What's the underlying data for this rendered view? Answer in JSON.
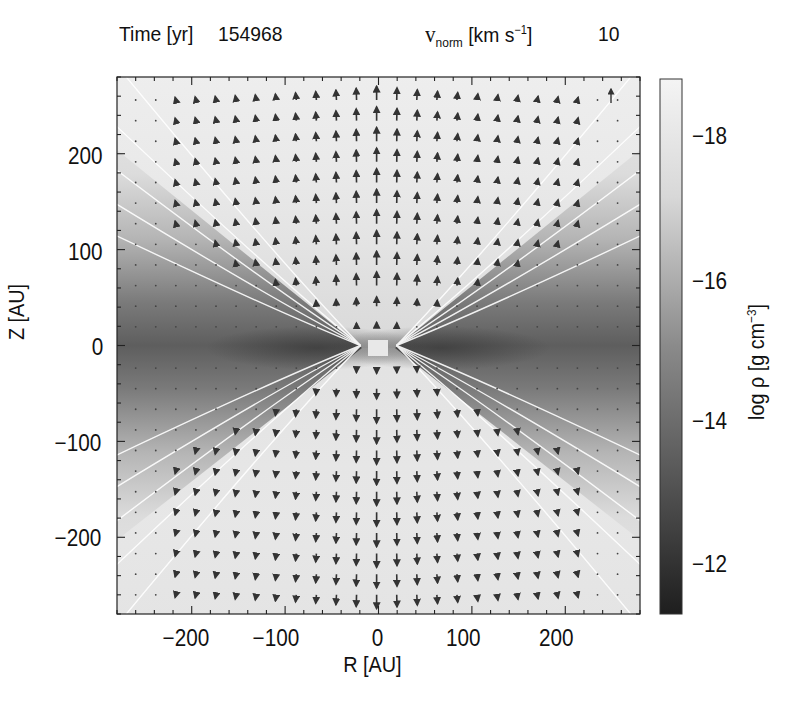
{
  "header": {
    "time_label": "Time [yr]",
    "time_value": "154968",
    "vnorm_symbol": "v",
    "vnorm_sub": "norm",
    "vnorm_unit_pre": "[km s",
    "vnorm_unit_sup": "−1",
    "vnorm_unit_post": "]",
    "vnorm_value": "10"
  },
  "colorbar": {
    "label_pre": "log ρ [g cm",
    "label_sup": "−3",
    "label_post": "]",
    "ticks": [
      "−18",
      "−16",
      "−14",
      "−12"
    ],
    "dark_color": "#222222",
    "light_color": "#f2f2f2"
  },
  "chart_data": {
    "type": "heatmap",
    "subtype": "density map with velocity vector overlay",
    "annotation": "v_norm [km s^-1] 10",
    "xlabel": "R [AU]",
    "ylabel": "Z [AU]",
    "xlim": [
      -280,
      280
    ],
    "ylim": [
      -280,
      280
    ],
    "xticks": [
      -200,
      -100,
      0,
      100,
      200
    ],
    "yticks": [
      -200,
      -100,
      0,
      100,
      200
    ],
    "xtick_labels": [
      "−200",
      "−100",
      "0",
      "100",
      "200"
    ],
    "ytick_labels": [
      "−200",
      "−100",
      "0",
      "100",
      "200"
    ],
    "colorbar": {
      "label": "log ρ [g cm^-3]",
      "range": [
        -11.4,
        -18.8
      ],
      "ticks": [
        -18,
        -16,
        -14,
        -12
      ],
      "colormap": "grayscale (dark = dense)"
    },
    "features": [
      "Dense dark disk along midplane Z=0 (log rho ~ -14 to -12)",
      "Low-density bipolar outflow cavity (light) opening above and below the disk",
      "White contour lines tracing cavity walls, converging at center",
      "Velocity vectors point upward (outflow) for Z>0 and downward for Z<0; longest near R=0 axis",
      "Reference velocity arrow of 10 km/s at top right"
    ],
    "grid": false,
    "legend_position": "colorbar right"
  }
}
